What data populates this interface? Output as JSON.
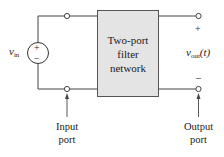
{
  "diagram": {
    "block": {
      "lines": [
        "Two-port",
        "filter",
        "network"
      ],
      "fill": "#e4e4e4",
      "stroke": "#555555"
    },
    "source": {
      "label_main": "v",
      "label_sub": "in",
      "plus": "+",
      "minus": "−"
    },
    "output": {
      "label_main": "v",
      "label_sub": "out",
      "label_arg": "(t)",
      "plus": "+",
      "minus": "–"
    },
    "ports": {
      "input": [
        "Input",
        "port"
      ],
      "output": [
        "Output",
        "port"
      ]
    },
    "wire_color": "#444444"
  }
}
